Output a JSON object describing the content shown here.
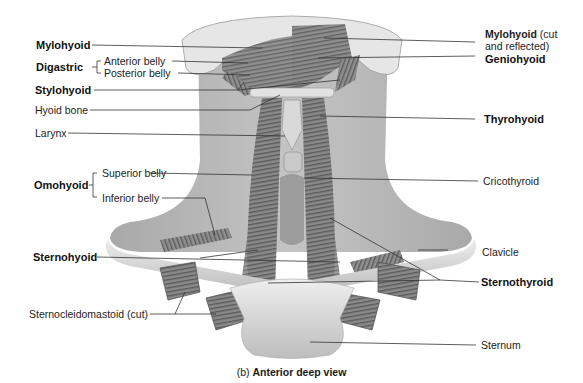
{
  "figure": {
    "caption_prefix": "(b)",
    "caption_title": "Anterior deep view",
    "colors": {
      "background": "#ffffff",
      "skin": "#b3b3b3",
      "muscle": "#7a7a7a",
      "muscle_dark": "#4f4f4f",
      "bone": "#d8d8d8",
      "leader_line": "#333333"
    }
  },
  "labels_left": {
    "mylohyoid": "Mylohyoid",
    "digastric": "Digastric",
    "digastric_anterior": "Anterior belly",
    "digastric_posterior": "Posterior belly",
    "stylohyoid": "Stylohyoid",
    "hyoid_bone": "Hyoid bone",
    "larynx": "Larynx",
    "omohyoid": "Omohyoid",
    "omohyoid_superior": "Superior belly",
    "omohyoid_inferior": "Inferior belly",
    "sternohyoid": "Sternohyoid",
    "sternocleidomastoid": "Sternocleidomastoid (cut)"
  },
  "labels_right": {
    "mylohyoid_cut": "Mylohyoid",
    "mylohyoid_cut_note1": "(cut",
    "mylohyoid_cut_note2": "and reflected)",
    "geniohyoid": "Geniohyoid",
    "thyrohyoid": "Thyrohyoid",
    "cricothyroid": "Cricothyroid",
    "clavicle": "Clavicle",
    "sternothyroid": "Sternothyroid",
    "sternum": "Sternum"
  }
}
